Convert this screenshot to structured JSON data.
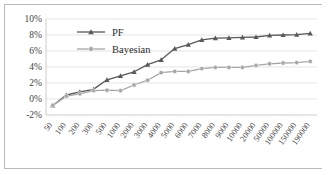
{
  "chart_data": {
    "type": "line",
    "title": "",
    "xlabel": "",
    "ylabel": "",
    "grid": true,
    "legend_position": "top-left-inside",
    "ylim": [
      -2,
      10
    ],
    "ytick_labels": [
      "10%",
      "8%",
      "6%",
      "4%",
      "2%",
      "0%",
      "-2%"
    ],
    "ytick_values": [
      10,
      8,
      6,
      4,
      2,
      0,
      -2
    ],
    "categories": [
      "50",
      "100",
      "200",
      "300",
      "500",
      "1000",
      "2000",
      "3000",
      "4000",
      "5000",
      "6000",
      "7000",
      "8000",
      "9000",
      "10000",
      "20000",
      "50000",
      "100000",
      "150000",
      "190000"
    ],
    "series": [
      {
        "name": "PF",
        "color": "#595959",
        "marker": "triangle",
        "values": [
          -0.8,
          0.5,
          0.9,
          1.2,
          2.4,
          2.9,
          3.4,
          4.3,
          4.9,
          6.3,
          6.8,
          7.4,
          7.6,
          7.65,
          7.7,
          7.75,
          7.95,
          8.0,
          8.05,
          8.2
        ]
      },
      {
        "name": "Bayesian",
        "color": "#a6a6a6",
        "marker": "circle",
        "values": [
          -0.8,
          0.35,
          0.65,
          1.05,
          1.1,
          1.05,
          1.75,
          2.35,
          3.3,
          3.45,
          3.45,
          3.8,
          3.95,
          3.95,
          3.95,
          4.2,
          4.4,
          4.5,
          4.55,
          4.7
        ]
      }
    ]
  },
  "legend": {
    "items": [
      {
        "label": "PF"
      },
      {
        "label": "Bayesian"
      }
    ]
  },
  "colors": {
    "pf": "#595959",
    "bayesian": "#a6a6a6",
    "grid": "#d9d9d9",
    "axis": "#bfbfbf",
    "border": "#b9b9b9",
    "text": "#3f3f3f"
  }
}
